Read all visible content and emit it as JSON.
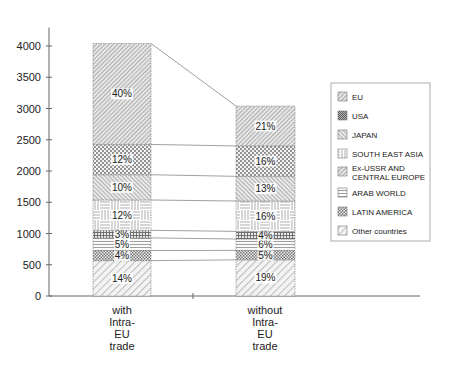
{
  "chart_data": {
    "type": "bar",
    "stacked": true,
    "title": "",
    "xlabel": "",
    "ylabel": "",
    "ylim": [
      0,
      4000
    ],
    "yticks": [
      0,
      500,
      1000,
      1500,
      2000,
      2500,
      3000,
      3500,
      4000
    ],
    "grid": false,
    "legend_position": "right",
    "categories": [
      "with Intra-EU trade",
      "without Intra-EU trade"
    ],
    "category_lines": [
      [
        "with",
        "Intra-",
        "EU",
        "trade"
      ],
      [
        "without",
        "Intra-",
        "EU",
        "trade"
      ]
    ],
    "totals": [
      4040,
      3040
    ],
    "series": [
      {
        "name": "Other countries",
        "percent": [
          14,
          19
        ],
        "values": [
          566,
          578
        ],
        "pattern": "diag-wide"
      },
      {
        "name": "LATIN AMERICA",
        "percent": [
          4,
          5
        ],
        "values": [
          162,
          152
        ],
        "pattern": "check"
      },
      {
        "name": "ARAB WORLD",
        "percent": [
          5,
          6
        ],
        "values": [
          202,
          182
        ],
        "pattern": "hlines"
      },
      {
        "name": "Ex-USSR AND CENTRAL EUROPE",
        "percent": [
          3,
          4
        ],
        "values": [
          121,
          122
        ],
        "pattern": "grid-dense"
      },
      {
        "name": "SOUTH EAST ASIA",
        "percent": [
          12,
          16
        ],
        "values": [
          485,
          486
        ],
        "pattern": "basket"
      },
      {
        "name": "JAPAN",
        "percent": [
          10,
          13
        ],
        "values": [
          404,
          395
        ],
        "pattern": "diag-back"
      },
      {
        "name": "USA",
        "percent": [
          12,
          16
        ],
        "values": [
          485,
          486
        ],
        "pattern": "dots"
      },
      {
        "name": "EU",
        "percent": [
          40,
          21
        ],
        "values": [
          1616,
          638
        ],
        "pattern": "diag-fine"
      }
    ],
    "legend_order": [
      "EU",
      "USA",
      "JAPAN",
      "SOUTH  EAST ASIA",
      "Ex-USSR AND CENTRAL EUROPE",
      "ARAB WORLD",
      "LATIN AMERICA",
      "Other countries"
    ]
  },
  "legend": {
    "items": [
      {
        "lines": [
          "EU"
        ],
        "pattern": "diag-fine"
      },
      {
        "lines": [
          "USA"
        ],
        "pattern": "dark-check"
      },
      {
        "lines": [
          "JAPAN"
        ],
        "pattern": "diag-back"
      },
      {
        "lines": [
          "SOUTH  EAST ASIA"
        ],
        "pattern": "basket"
      },
      {
        "lines": [
          "Ex-USSR AND",
          "CENTRAL EUROPE"
        ],
        "pattern": "diag-fine"
      },
      {
        "lines": [
          "ARAB WORLD"
        ],
        "pattern": "hlines"
      },
      {
        "lines": [
          "LATIN AMERICA"
        ],
        "pattern": "check"
      },
      {
        "lines": [
          "Other countries"
        ],
        "pattern": "diag-wide"
      }
    ]
  }
}
